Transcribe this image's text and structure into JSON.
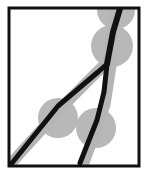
{
  "figure": {
    "canvas": {
      "width": 148,
      "height": 179
    },
    "background_color": "#ffffff"
  },
  "frame": {
    "name": "bounding-box",
    "x": 9,
    "y": 8,
    "width": 130,
    "height": 158,
    "stroke_color": "#111111",
    "stroke_width": 3,
    "fill_color": "#ffffff"
  },
  "colors": {
    "path_black": "#111111",
    "trace_gray": "#b5b5b5",
    "node_gray": "#b8b8b8",
    "frame_stroke": "#111111",
    "background": "#ffffff"
  },
  "nodes": [
    {
      "label": "node-top-right",
      "cx": 116,
      "cy": 10,
      "r": 19,
      "color": "#b8b8b8"
    },
    {
      "label": "node-upper-right",
      "cx": 112,
      "cy": 46,
      "r": 21,
      "color": "#b8b8b8"
    },
    {
      "label": "node-mid-left",
      "cx": 58,
      "cy": 118,
      "r": 20,
      "color": "#b8b8b8"
    },
    {
      "label": "node-lower-right",
      "cx": 96,
      "cy": 128,
      "r": 20,
      "color": "#b8b8b8"
    }
  ],
  "traces": [
    {
      "label": "trace-trunk",
      "points": "118,2 112,34 107,62",
      "color": "#b5b5b5",
      "width": 11
    },
    {
      "label": "trace-left-branch",
      "points": "103,66 62,107 14,160",
      "color": "#b5b5b5",
      "width": 11
    },
    {
      "label": "trace-right-branch",
      "points": "111,66 105,105 84,163",
      "color": "#b5b5b5",
      "width": 11
    }
  ],
  "paths": [
    {
      "label": "path-trunk",
      "points": "122,2 113,32 107,64",
      "color": "#111111",
      "width": 6
    },
    {
      "label": "path-left-branch",
      "points": "107,64 98,72 58,106 12,163",
      "color": "#111111",
      "width": 5
    },
    {
      "label": "path-right-branch",
      "points": "107,64 104,92 97,120 80,163",
      "color": "#111111",
      "width": 5
    }
  ],
  "junction": {
    "label": "fork-point",
    "x": 107,
    "y": 64
  }
}
